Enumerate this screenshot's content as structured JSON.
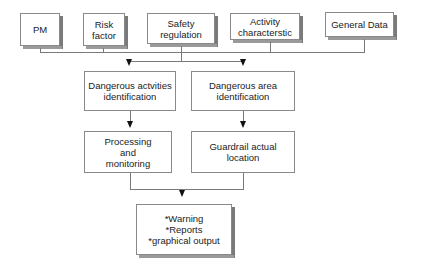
{
  "diagram": {
    "inputs": [
      {
        "id": "pm",
        "label": "PM"
      },
      {
        "id": "risk",
        "label": "Risk factor"
      },
      {
        "id": "safety",
        "label": "Safety regulation"
      },
      {
        "id": "activity",
        "label": "Activity characterstic"
      },
      {
        "id": "general",
        "label": "General Data"
      }
    ],
    "process": {
      "left_top": "Dangerous actvities identification",
      "right_top": "Dangerous area identification",
      "left_bottom": "Processing and monitoring",
      "right_bottom": "Guardrail actual location"
    },
    "output": {
      "lines": [
        "*Warning",
        "*Reports",
        "*graphical output"
      ]
    }
  }
}
